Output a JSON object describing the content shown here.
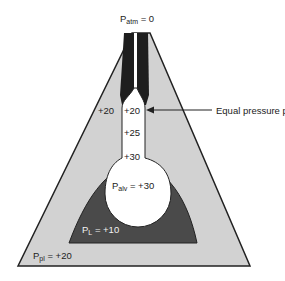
{
  "diagram": {
    "title_label": {
      "main": "P",
      "sub": "atm",
      "rest": " = 0"
    },
    "callout": "Equal pressure point",
    "pleural_label": {
      "main": "P",
      "sub": "pl",
      "rest": " = +20"
    },
    "lung_label": {
      "main": "P",
      "sub": "L",
      "rest": " = +10"
    },
    "alveolar_label": {
      "main": "P",
      "sub": "alv",
      "rest": " = +30"
    },
    "airway_values": [
      "+20",
      "+25",
      "+30"
    ],
    "outside_value": "+20",
    "colors": {
      "pleural_fill": "#d2d2d2",
      "lung_fill": "#4a4a4a",
      "airway_wall": "#1e1e1e",
      "lumen": "#ffffff",
      "outline": "#222222"
    }
  }
}
